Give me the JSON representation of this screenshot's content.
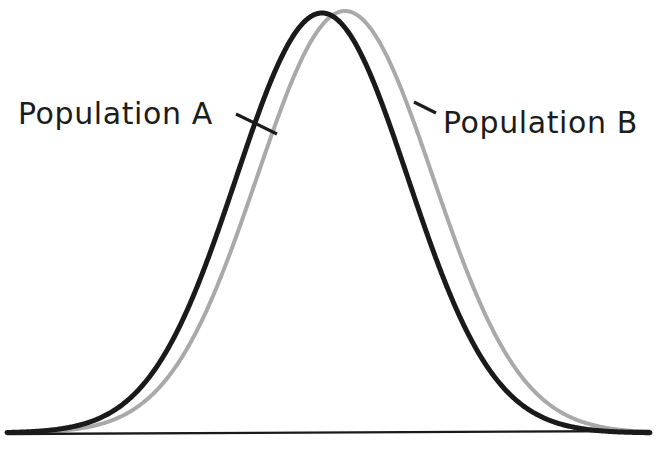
{
  "figure": {
    "background_color": "#ffffff",
    "width": 665,
    "height": 451
  },
  "axis": {
    "name": "baseline-axis",
    "color": "#1a1a1a",
    "x_start": 7,
    "y_start": 434,
    "x_end": 650,
    "y_end": 431,
    "thickness": 2.4
  },
  "labels": {
    "population_a": "Population A",
    "population_b": "Population B",
    "text_color": "#1c1c1c",
    "font_size": 30
  },
  "leaders": {
    "a": {
      "x1": 236,
      "y1": 114,
      "x2": 277,
      "y2": 134
    },
    "b": {
      "x1": 436,
      "y1": 113,
      "x2": 414,
      "y2": 102
    },
    "color": "#1c1c1c",
    "thickness": 3.2
  },
  "label_positions": {
    "a": {
      "x": 18,
      "y": 124
    },
    "b": {
      "x": 443,
      "y": 133
    }
  },
  "chart_data": {
    "type": "line",
    "title": "",
    "subtitle": "",
    "xlabel": "",
    "ylabel": "",
    "grid": false,
    "legend_position": "inline-annotations",
    "axis_visible": {
      "x": true,
      "y": false
    },
    "xlim": [
      7,
      650
    ],
    "ylim": [
      0,
      1
    ],
    "baseline_y_px": 433,
    "peak_y_px": 13,
    "annotations": [
      {
        "text": "Population A",
        "series": "Population A",
        "x_px": 18,
        "y_px": 124
      },
      {
        "text": "Population B",
        "series": "Population B",
        "x_px": 443,
        "y_px": 133
      }
    ],
    "series": [
      {
        "name": "Population A",
        "color": "#1a1a1a",
        "stroke_width": 5,
        "distribution": "normal",
        "mean_px": 322,
        "sigma_px": 86,
        "peak_px": {
          "x": 322,
          "y": 13
        },
        "amplitude_px": 420,
        "x": [
          7,
          45,
          80,
          110,
          140,
          165,
          190,
          210,
          230,
          250,
          270,
          290,
          305,
          322,
          340,
          355,
          375,
          395,
          415,
          435,
          455,
          480,
          505,
          535,
          565,
          600,
          650
        ],
        "values": [
          0.0,
          0.002,
          0.008,
          0.022,
          0.053,
          0.098,
          0.167,
          0.244,
          0.337,
          0.445,
          0.565,
          0.708,
          0.815,
          0.955,
          0.895,
          0.803,
          0.651,
          0.496,
          0.356,
          0.242,
          0.155,
          0.078,
          0.035,
          0.011,
          0.003,
          0.0,
          0.0
        ]
      },
      {
        "name": "Population B",
        "color": "#a9a9a9",
        "stroke_width": 4,
        "distribution": "normal",
        "mean_px": 345,
        "sigma_px": 88,
        "peak_px": {
          "x": 345,
          "y": 11
        },
        "amplitude_px": 422,
        "x": [
          7,
          45,
          80,
          110,
          140,
          165,
          190,
          210,
          235,
          258,
          280,
          300,
          320,
          345,
          365,
          385,
          405,
          425,
          445,
          465,
          490,
          515,
          545,
          575,
          605,
          630,
          650
        ],
        "values": [
          0.0,
          0.001,
          0.005,
          0.014,
          0.035,
          0.066,
          0.112,
          0.166,
          0.256,
          0.355,
          0.47,
          0.583,
          0.703,
          0.96,
          0.878,
          0.775,
          0.65,
          0.52,
          0.393,
          0.281,
          0.17,
          0.094,
          0.037,
          0.012,
          0.003,
          0.001,
          0.0
        ]
      }
    ]
  }
}
